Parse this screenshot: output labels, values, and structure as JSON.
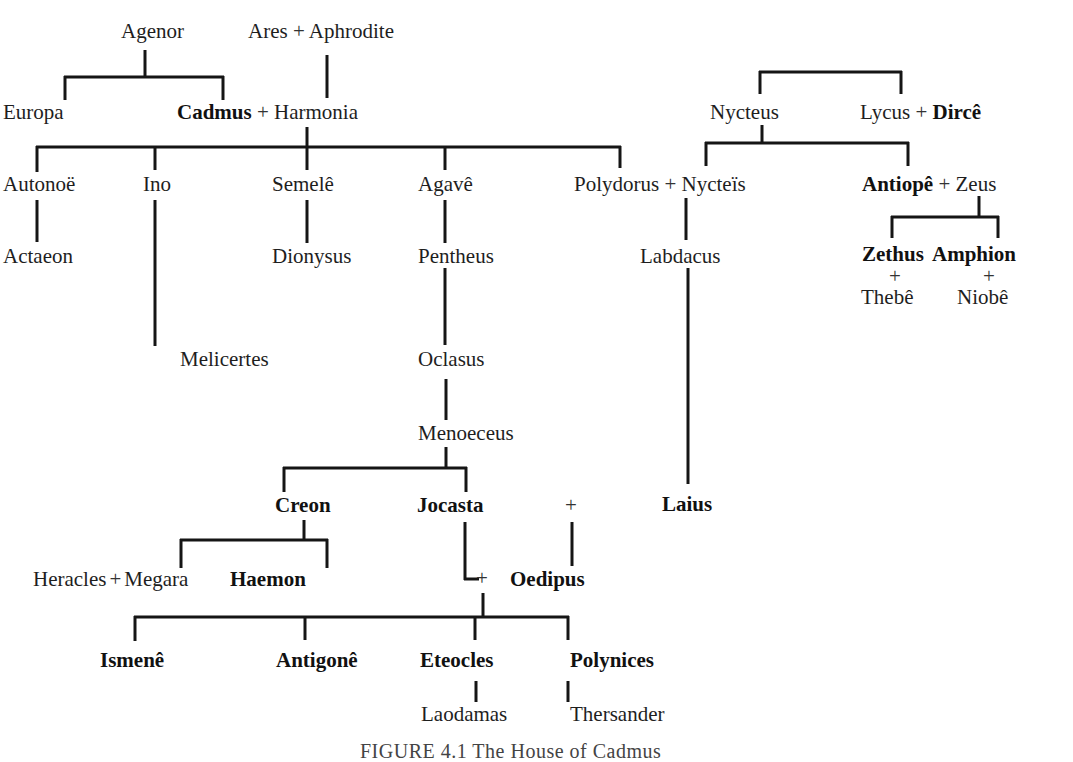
{
  "diagram": {
    "type": "family-tree",
    "caption": "FIGURE 4.1 The House of Cadmus",
    "people": {
      "agenor": "Agenor",
      "ares_aphrodite": [
        "Ares",
        "+",
        "Aphrodite"
      ],
      "europa": "Europa",
      "cadmus_harmonia": [
        "Cadmus",
        "+",
        "Harmonia"
      ],
      "nycteus": "Nycteus",
      "lycus_dirce": [
        "Lycus",
        "+",
        "Dircê"
      ],
      "autonoe": "Autonoë",
      "ino": "Ino",
      "semele": "Semelê",
      "agave": "Agavê",
      "polydorus_nycteis": [
        "Polydorus",
        "+",
        "Nycteïs"
      ],
      "antiope_zeus": [
        "Antiopê",
        "+",
        "Zeus"
      ],
      "actaeon": "Actaeon",
      "dionysus": "Dionysus",
      "pentheus": "Pentheus",
      "labdacus": "Labdacus",
      "zethus": "Zethus",
      "amphion": "Amphion",
      "zethus_plus": "+",
      "amphion_plus": "+",
      "thebe": "Thebê",
      "niobe": "Niobê",
      "melicertes": "Melicertes",
      "oclasus": "Oclasus",
      "menoeceus": "Menoeceus",
      "creon": "Creon",
      "jocasta": "Jocasta",
      "oedipus_plus": "+",
      "laius": "Laius",
      "heracles_megara": [
        "Heracles",
        "+",
        "Megara"
      ],
      "haemon": "Haemon",
      "jocasta_oedipus_plus": "+",
      "oedipus": "Oedipus",
      "ismene": "Ismenê",
      "antigone": "Antigonê",
      "eteocles": "Eteocles",
      "polynices": "Polynices",
      "laodamas": "Laodamas",
      "thersander": "Thersander"
    },
    "relations": [
      {
        "parents": [
          "Agenor"
        ],
        "children": [
          "Europa",
          "Cadmus"
        ]
      },
      {
        "parents": [
          "Ares",
          "Aphrodite"
        ],
        "children": [
          "Harmonia"
        ]
      },
      {
        "parents": [
          "Cadmus",
          "Harmonia"
        ],
        "children": [
          "Autonoë",
          "Ino",
          "Semelê",
          "Agavê",
          "Polydorus"
        ]
      },
      {
        "parents": [],
        "children": [
          "Nycteus",
          "Lycus"
        ]
      },
      {
        "parents": [
          "Nycteus"
        ],
        "children": [
          "Nycteïs",
          "Antiopê"
        ]
      },
      {
        "parents": [
          "Antiopê",
          "Zeus"
        ],
        "children": [
          "Zethus",
          "Amphion"
        ]
      },
      {
        "parents": [
          "Autonoë"
        ],
        "children": [
          "Actaeon"
        ]
      },
      {
        "parents": [
          "Ino"
        ],
        "children": [
          "Melicertes"
        ]
      },
      {
        "parents": [
          "Semelê"
        ],
        "children": [
          "Dionysus"
        ]
      },
      {
        "parents": [
          "Agavê"
        ],
        "children": [
          "Pentheus"
        ]
      },
      {
        "parents": [
          "Pentheus"
        ],
        "children": [
          "Oclasus"
        ]
      },
      {
        "parents": [
          "Oclasus"
        ],
        "children": [
          "Menoeceus"
        ]
      },
      {
        "parents": [
          "Menoeceus"
        ],
        "children": [
          "Creon",
          "Jocasta"
        ]
      },
      {
        "parents": [
          "Polydorus",
          "Nycteïs"
        ],
        "children": [
          "Labdacus"
        ]
      },
      {
        "parents": [
          "Labdacus"
        ],
        "children": [
          "Laius"
        ]
      },
      {
        "parents": [
          "Laius",
          "Jocasta"
        ],
        "children": [
          "Oedipus"
        ]
      },
      {
        "parents": [
          "Creon"
        ],
        "children": [
          "Megara",
          "Haemon"
        ]
      },
      {
        "parents": [
          "Jocasta",
          "Oedipus"
        ],
        "children": [
          "Ismenê",
          "Antigonê",
          "Eteocles",
          "Polynices"
        ]
      },
      {
        "parents": [
          "Eteocles"
        ],
        "children": [
          "Laodamas"
        ]
      },
      {
        "parents": [
          "Polynices"
        ],
        "children": [
          "Thersander"
        ]
      }
    ]
  }
}
